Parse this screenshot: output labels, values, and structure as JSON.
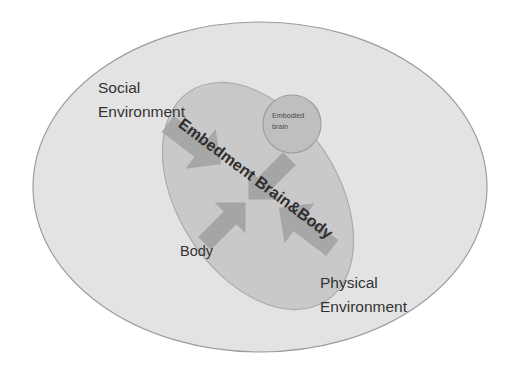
{
  "diagram": {
    "background_color": "#ffffff",
    "shapes": {
      "outer_ellipse": {
        "name": "social-environment-ellipse",
        "label": "Social\nEnvironment",
        "fill": "#e3e3e3",
        "stroke": "#9a9a9a",
        "cx": 260,
        "cy": 187,
        "rx": 227,
        "ry": 165,
        "rotation": 0
      },
      "inner_ellipse": {
        "name": "body-ellipse",
        "label": "Body",
        "fill": "#c9c9c9",
        "stroke": "#a8a8a8",
        "cx": 258,
        "cy": 196,
        "rx": 80,
        "ry": 125,
        "rotation": -33
      },
      "brain_circle": {
        "name": "embodied-brain-circle",
        "fill": "#bfbfbf",
        "stroke": "#9d9d9d",
        "cx": 292,
        "cy": 124,
        "r": 29
      }
    },
    "labels": {
      "social_environment": {
        "line1": "Social",
        "line2": "Environment"
      },
      "physical_environment": {
        "line1": "Physical",
        "line2": "Environment"
      },
      "body": "Body",
      "embodied_brain": {
        "line1": "Embodied",
        "line2": "brain"
      },
      "embedment_relation": "Embedment Brain&Body"
    },
    "arrows": [
      {
        "name": "embedment-diagonal-arrow",
        "description": "double-headed arrow from upper-left to lower-right",
        "direction": "bidirectional",
        "angle_deg": 37,
        "fill": "#a5a5a5"
      },
      {
        "name": "brain-body-arrow",
        "description": "double-headed arrow from lower-left to upper-right",
        "direction": "bidirectional",
        "angle_deg": -45,
        "fill": "#a5a5a5"
      }
    ],
    "colors": {
      "outer_fill": "#e3e3e3",
      "inner_fill": "#c9c9c9",
      "brain_fill": "#bfbfbf",
      "arrow_fill": "#a5a5a5",
      "text": "#333333"
    }
  }
}
